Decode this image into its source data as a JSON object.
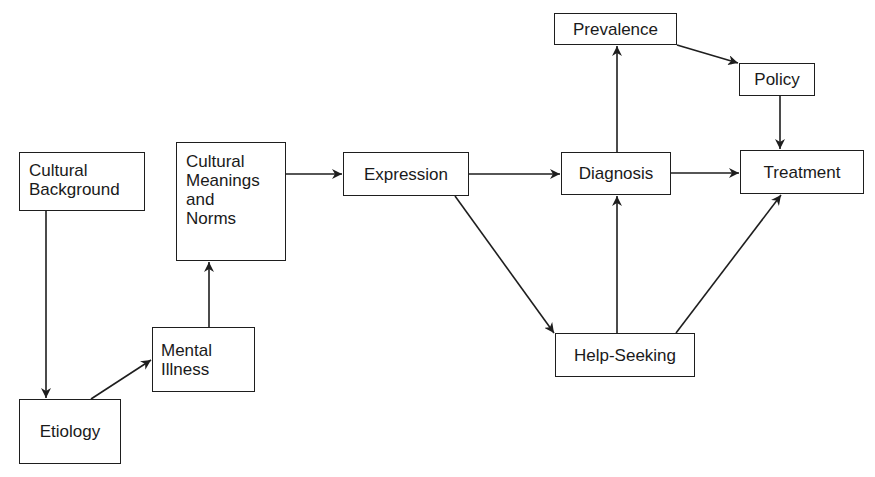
{
  "diagram": {
    "type": "flow",
    "nodes": [
      {
        "id": "cultural_background",
        "label": "Cultural Background",
        "lines": [
          "Cultural",
          "Background"
        ],
        "box": [
          19,
          152,
          126,
          59
        ]
      },
      {
        "id": "cultural_meanings",
        "label": "Cultural Meanings and Norms",
        "lines": [
          "Cultural",
          "Meanings",
          "and",
          "Norms"
        ],
        "box": [
          176,
          142,
          110,
          119
        ]
      },
      {
        "id": "mental_illness",
        "label": "Mental Illness",
        "lines": [
          "Mental",
          "Illness"
        ],
        "box": [
          152,
          327,
          103,
          65
        ]
      },
      {
        "id": "etiology",
        "label": "Etiology",
        "lines": [
          "Etiology"
        ],
        "box": [
          19,
          399,
          102,
          65
        ]
      },
      {
        "id": "expression",
        "label": "Expression",
        "lines": [
          "Expression"
        ],
        "box": [
          343,
          152,
          126,
          44
        ]
      },
      {
        "id": "prevalence",
        "label": "Prevalence",
        "lines": [
          "Prevalence"
        ],
        "box": [
          554,
          13,
          123,
          32
        ]
      },
      {
        "id": "diagnosis",
        "label": "Diagnosis",
        "lines": [
          "Diagnosis"
        ],
        "box": [
          561,
          152,
          110,
          43
        ]
      },
      {
        "id": "policy",
        "label": "Policy",
        "lines": [
          "Policy"
        ],
        "box": [
          739,
          63,
          76,
          33
        ]
      },
      {
        "id": "treatment",
        "label": "Treatment",
        "lines": [
          "Treatment"
        ],
        "box": [
          740,
          150,
          124,
          44
        ]
      },
      {
        "id": "help_seeking",
        "label": "Help-Seeking",
        "lines": [
          "Help-Seeking"
        ],
        "box": [
          555,
          333,
          140,
          44
        ]
      }
    ],
    "edges": [
      {
        "from": "cultural_background",
        "to": "etiology"
      },
      {
        "from": "etiology",
        "to": "mental_illness"
      },
      {
        "from": "mental_illness",
        "to": "cultural_meanings"
      },
      {
        "from": "cultural_meanings",
        "to": "expression"
      },
      {
        "from": "expression",
        "to": "diagnosis"
      },
      {
        "from": "expression",
        "to": "help_seeking"
      },
      {
        "from": "diagnosis",
        "to": "prevalence"
      },
      {
        "from": "diagnosis",
        "to": "treatment"
      },
      {
        "from": "prevalence",
        "to": "policy"
      },
      {
        "from": "policy",
        "to": "treatment"
      },
      {
        "from": "help_seeking",
        "to": "diagnosis"
      },
      {
        "from": "help_seeking",
        "to": "treatment"
      }
    ],
    "colors": {
      "stroke": "#1e1e1e",
      "background": "#ffffff"
    }
  }
}
